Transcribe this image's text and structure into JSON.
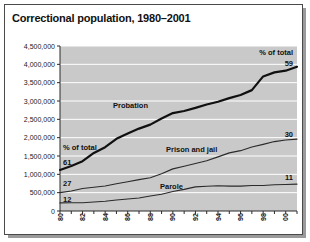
{
  "card": {
    "title": "Correctional population, 1980–2001"
  },
  "annotations": {
    "top_right_pct_label": "% of total",
    "top_right_pct_value": "59",
    "left_pct_label": "% of total",
    "left_pct_probation": "61",
    "left_pct_prison": "27",
    "left_pct_parole": "12",
    "right_pct_prison": "30",
    "right_pct_parole": "11",
    "label_probation": "Probation",
    "label_prison": "Prison and jail",
    "label_parole": "Parole"
  },
  "colors": {
    "plot_background": "#c9c9c9",
    "gridline": "#ffffff",
    "axis": "#2b2b2b",
    "probation_line": "#101010",
    "prison_line": "#2a2a2a",
    "parole_line": "#2a2a2a",
    "card_border": "#4a4a4a",
    "shadow": "#9a9a9a"
  },
  "chart_data": {
    "type": "line",
    "title": "Correctional population, 1980–2001",
    "xlabel": "",
    "ylabel": "",
    "grid": true,
    "legend": "inline-labels",
    "ylim": [
      0,
      4500000
    ],
    "ytick_values": [
      0,
      500000,
      1000000,
      1500000,
      2000000,
      2500000,
      3000000,
      3500000,
      4000000,
      4500000
    ],
    "ytick_labels": [
      "0",
      "500,000",
      "1,000,000",
      "1,500,000",
      "2,000,000",
      "2,500,000",
      "3,000,000",
      "3,500,000",
      "4,000,000",
      "4,500,000"
    ],
    "x": [
      1980,
      1981,
      1982,
      1983,
      1984,
      1985,
      1986,
      1987,
      1988,
      1989,
      1990,
      1991,
      1992,
      1993,
      1994,
      1995,
      1996,
      1997,
      1998,
      1999,
      2000,
      2001
    ],
    "xtick_labels": [
      "80",
      "",
      "82",
      "",
      "84",
      "",
      "86",
      "",
      "88",
      "",
      "90",
      "",
      "92",
      "",
      "94",
      "",
      "96",
      "",
      "98",
      "",
      "00",
      ""
    ],
    "xtick_labels_shown": [
      "80",
      "82",
      "84",
      "86",
      "88",
      "90",
      "92",
      "94",
      "96",
      "98",
      "00"
    ],
    "series": [
      {
        "name": "Probation",
        "percent_of_total_start": 61,
        "percent_of_total_end": 59,
        "values": [
          1118097,
          1225934,
          1357264,
          1582947,
          1740948,
          1968712,
          2114621,
          2247158,
          2356483,
          2522125,
          2670234,
          2728472,
          2811611,
          2903061,
          2981022,
          3077861,
          3164996,
          3296513,
          3670441,
          3779922,
          3826209,
          3932751
        ]
      },
      {
        "name": "Prison and jail",
        "percent_of_total_start": 27,
        "percent_of_total_end": 30,
        "values": [
          501886,
          545300,
          612496,
          647000,
          681000,
          744208,
          800000,
          856000,
          908000,
          1018000,
          1148702,
          1219014,
          1295150,
          1369185,
          1476621,
          1585586,
          1646020,
          1743643,
          1816931,
          1893115,
          1937482,
          1961247
        ]
      },
      {
        "name": "Parole",
        "percent_of_total_start": 12,
        "percent_of_total_end": 11,
        "values": [
          220438,
          225539,
          224604,
          246440,
          266992,
          300203,
          325638,
          355505,
          407977,
          456803,
          531407,
          590442,
          658601,
          676100,
          690371,
          679421,
          679733,
          694787,
          696385,
          714457,
          723898,
          732333
        ]
      }
    ]
  }
}
